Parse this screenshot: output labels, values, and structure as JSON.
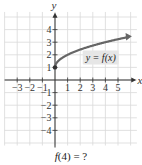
{
  "chart_data": {
    "type": "line",
    "title": "",
    "xlabel": "x",
    "ylabel": "y",
    "xlim": [
      -4,
      6
    ],
    "ylim": [
      -5,
      5
    ],
    "grid": true,
    "x_ticks": [
      -3,
      -2,
      -1,
      1,
      2,
      3,
      4,
      5
    ],
    "y_ticks": [
      -4,
      -3,
      -2,
      -1,
      1,
      2,
      3,
      4
    ],
    "x_tick_labels": [
      "−3",
      "−2",
      "−1",
      "1",
      "2",
      "3",
      "4",
      "5"
    ],
    "y_tick_labels": [
      "−4",
      "−3",
      "−2",
      "−1",
      "1",
      "2",
      "3",
      "4"
    ],
    "series": [
      {
        "name": "y = f(x)",
        "description": "Curve starting at closed point (0,1), increasing and concave down (square-root shape), with arrow continuing right",
        "x": [
          0,
          0.25,
          0.5,
          1,
          2,
          3,
          4,
          5,
          5.8
        ],
        "y": [
          1,
          1.5,
          1.71,
          2,
          2.41,
          2.73,
          3,
          3.24,
          3.41
        ],
        "start_point": {
          "x": 0,
          "y": 1,
          "closed": true
        },
        "end_arrow": true,
        "color": "#666666"
      }
    ],
    "annotations": [
      {
        "text": "y = f(x)",
        "x": 3.3,
        "y": 1.8,
        "boxed": true,
        "box_color": "#e6e6e6"
      }
    ]
  },
  "caption": {
    "prefix": "f",
    "rest": "(4) = ?"
  },
  "labels": {
    "curve_label": "y = f(x)",
    "x_axis": "x",
    "y_axis": "y"
  },
  "colors": {
    "grid": "#d9d9d9",
    "axis": "#333333",
    "curve": "#666666",
    "label_box": "#e6e6e6"
  }
}
